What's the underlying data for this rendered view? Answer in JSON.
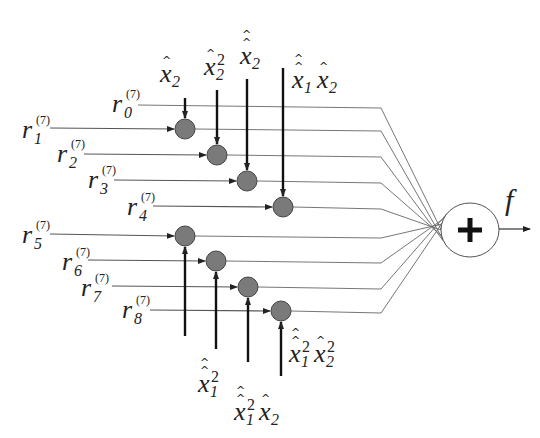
{
  "diagram": {
    "colors": {
      "background": "#ffffff",
      "line": "#555555",
      "thin_line": "#666666",
      "multiplier_fill": "#7a7a7a",
      "multiplier_stroke": "#444444",
      "sum_fill": "#ffffff",
      "sum_stroke": "#555555",
      "text": "#222222"
    },
    "inputs": [
      {
        "name": "r",
        "sub": "0",
        "sup": "(7)",
        "label_x": 112,
        "label_y": 112,
        "line_start_x": 138,
        "y": 105,
        "multiplier": null
      },
      {
        "name": "r",
        "sub": "1",
        "sup": "(7)",
        "label_x": 22,
        "label_y": 138,
        "line_start_x": 50,
        "y": 128,
        "multiplier": 0
      },
      {
        "name": "r",
        "sub": "2",
        "sup": "(7)",
        "label_x": 57,
        "label_y": 162,
        "line_start_x": 84,
        "y": 154,
        "multiplier": 1
      },
      {
        "name": "r",
        "sub": "3",
        "sup": "(7)",
        "label_x": 88,
        "label_y": 188,
        "line_start_x": 114,
        "y": 180,
        "multiplier": 2
      },
      {
        "name": "r",
        "sub": "4",
        "sup": "(7)",
        "label_x": 127,
        "label_y": 215,
        "line_start_x": 153,
        "y": 206,
        "multiplier": 3
      },
      {
        "name": "r",
        "sub": "5",
        "sup": "(7)",
        "label_x": 22,
        "label_y": 243,
        "line_start_x": 50,
        "y": 234,
        "multiplier": 4
      },
      {
        "name": "r",
        "sub": "6",
        "sup": "(7)",
        "label_x": 62,
        "label_y": 270,
        "line_start_x": 88,
        "y": 260,
        "multiplier": 5
      },
      {
        "name": "r",
        "sub": "7",
        "sup": "(7)",
        "label_x": 81,
        "label_y": 296,
        "line_start_x": 112,
        "y": 286,
        "multiplier": 6
      },
      {
        "name": "r",
        "sub": "8",
        "sup": "(7)",
        "label_x": 122,
        "label_y": 318,
        "line_start_x": 150,
        "y": 310,
        "multiplier": 7
      }
    ],
    "multipliers": [
      {
        "cx": 185,
        "cy": 129,
        "r": 10,
        "ctrl_from": "top",
        "ctrl_end_y": 98
      },
      {
        "cx": 217,
        "cy": 155,
        "r": 10,
        "ctrl_from": "top",
        "ctrl_end_y": 90
      },
      {
        "cx": 247,
        "cy": 181,
        "r": 10,
        "ctrl_from": "top",
        "ctrl_end_y": 79
      },
      {
        "cx": 283,
        "cy": 207,
        "r": 10,
        "ctrl_from": "top",
        "ctrl_end_y": 68
      },
      {
        "cx": 185,
        "cy": 236,
        "r": 10,
        "ctrl_from": "bottom",
        "ctrl_end_y": 336
      },
      {
        "cx": 216,
        "cy": 261,
        "r": 10,
        "ctrl_from": "bottom",
        "ctrl_end_y": 349
      },
      {
        "cx": 248,
        "cy": 287,
        "r": 10,
        "ctrl_from": "bottom",
        "ctrl_end_y": 362
      },
      {
        "cx": 281,
        "cy": 311,
        "r": 10,
        "ctrl_from": "bottom",
        "ctrl_end_y": 376
      }
    ],
    "control_labels": [
      {
        "id": "top-1",
        "x": 160,
        "y": 82,
        "terms": [
          {
            "var": "x",
            "sub": "2",
            "sup": "",
            "hats": 1
          }
        ]
      },
      {
        "id": "top-2",
        "x": 204,
        "y": 75,
        "terms": [
          {
            "var": "x",
            "sub": "2",
            "sup": "2",
            "hats": 1
          }
        ]
      },
      {
        "id": "top-3",
        "x": 240,
        "y": 64,
        "terms": [
          {
            "var": "x",
            "sub": "2",
            "sup": "",
            "hats": 2
          }
        ]
      },
      {
        "id": "top-4",
        "x": 292,
        "y": 88,
        "terms": [
          {
            "var": "x",
            "sub": "1",
            "sup": "",
            "hats": 2
          },
          {
            "var": "x",
            "sub": "2",
            "sup": "",
            "hats": 1
          }
        ]
      },
      {
        "id": "bot-1",
        "x": 198,
        "y": 392,
        "terms": [
          {
            "var": "x",
            "sub": "1",
            "sup": "2",
            "hats": 2
          }
        ]
      },
      {
        "id": "bot-2",
        "x": 234,
        "y": 420,
        "terms": [
          {
            "var": "x",
            "sub": "1",
            "sup": "2",
            "hats": 2
          },
          {
            "var": "x",
            "sub": "2",
            "sup": "",
            "hats": 1
          }
        ]
      },
      {
        "id": "bot-3",
        "x": 289,
        "y": 362,
        "terms": [
          {
            "var": "x",
            "sub": "1",
            "sup": "2",
            "hats": 2
          },
          {
            "var": "x",
            "sub": "2",
            "sup": "2",
            "hats": 1
          }
        ]
      }
    ],
    "merge_x": 381,
    "summer": {
      "cx": 470,
      "cy": 230,
      "rx": 29,
      "ry": 27,
      "symbol": "+"
    },
    "output": {
      "label": "f",
      "x1": 499,
      "x2": 530,
      "y": 229,
      "label_x": 505,
      "label_y": 210
    }
  }
}
